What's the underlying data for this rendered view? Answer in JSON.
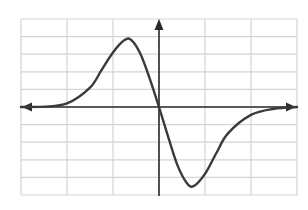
{
  "chart_data": {
    "type": "line",
    "title": "",
    "xlabel": "",
    "ylabel": "",
    "grid": true,
    "legend": null,
    "xlim": [
      -3,
      3
    ],
    "ylim": [
      -5,
      5
    ],
    "grid_columns": 6,
    "grid_rows": 10,
    "axes": {
      "x_arrows": "both",
      "y_arrows": "up"
    },
    "series": [
      {
        "name": "curve",
        "description": "odd function shaped like -x*exp(-x^2): peak left of origin, trough right of origin, tails approaching 0",
        "x": [
          -3.0,
          -2.5,
          -2.0,
          -1.5,
          -1.25,
          -1.0,
          -0.75,
          -0.6,
          -0.4,
          -0.2,
          0.0,
          0.2,
          0.4,
          0.6,
          0.75,
          1.0,
          1.25,
          1.5,
          2.0,
          2.5,
          3.0
        ],
        "y": [
          0.0,
          0.02,
          0.2,
          1.1,
          2.1,
          3.1,
          3.8,
          3.8,
          3.0,
          1.6,
          0.0,
          -1.7,
          -3.3,
          -4.3,
          -4.5,
          -3.8,
          -2.6,
          -1.5,
          -0.45,
          -0.1,
          0.0
        ]
      }
    ],
    "annotations": []
  },
  "colors": {
    "grid": "#d4d4d4",
    "axis": "#2a2a2a",
    "curve": "#3a3a3a",
    "background": "#ffffff"
  }
}
